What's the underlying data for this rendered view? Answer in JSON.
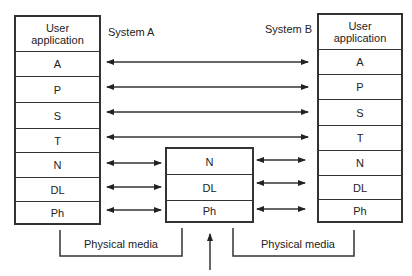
{
  "diagram": {
    "system_a": {
      "label": "System A",
      "layers": [
        "User application",
        "A",
        "P",
        "S",
        "T",
        "N",
        "DL",
        "Ph"
      ]
    },
    "system_b": {
      "label": "System B",
      "layers": [
        "User application",
        "A",
        "P",
        "S",
        "T",
        "N",
        "DL",
        "Ph"
      ]
    },
    "relay": {
      "layers": [
        "N",
        "DL",
        "Ph"
      ]
    },
    "media": {
      "left_label": "Physical media",
      "right_label": "Physical media"
    },
    "colors": {
      "stroke": "#333333",
      "background": "#ffffff"
    }
  }
}
